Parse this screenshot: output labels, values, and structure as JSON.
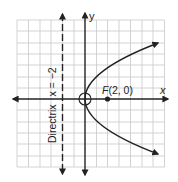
{
  "diagram": {
    "axes": {
      "x_label": "x",
      "y_label": "y"
    },
    "grid": {
      "x_min": -6,
      "x_max": 7,
      "y_min": -6,
      "y_max": 7,
      "unit": 1
    },
    "focus": {
      "label_prefix": "F",
      "label_coords": "(2, 0)",
      "x": 2,
      "y": 0
    },
    "directrix": {
      "label_word": "Directrix",
      "label_equation": "x = −2",
      "x": -2
    },
    "vertex": {
      "x": 0,
      "y": 0,
      "marker": "open-circle"
    },
    "parabola": {
      "equation": "y^2 = 8x",
      "opens": "right"
    },
    "colors": {
      "ink": "#222222",
      "grid": "#c8c8c8",
      "background": "#ffffff"
    }
  }
}
